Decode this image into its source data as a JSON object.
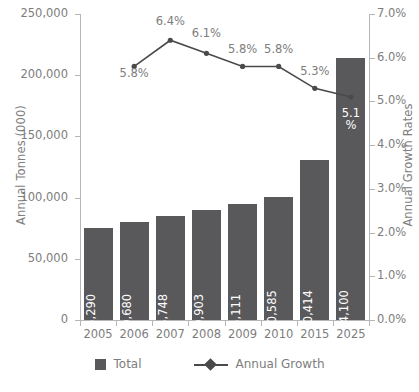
{
  "chart_data": {
    "type": "bar",
    "title": "",
    "subtitle": "",
    "xlabel": "",
    "ylabel": "Annual Tonnes (000)",
    "y2label": "Annual Growth Rates",
    "categories": [
      "2005",
      "2006",
      "2007",
      "2008",
      "2009",
      "2010",
      "2015",
      "2025"
    ],
    "grid": false,
    "legend_position": "bottom",
    "ylim": [
      0,
      250000
    ],
    "yticks": [
      0,
      50000,
      100000,
      150000,
      200000,
      250000
    ],
    "ytick_labels": [
      "0",
      "50,000",
      "100,000",
      "150,000",
      "200,000",
      "250,000"
    ],
    "y2lim": [
      0,
      7
    ],
    "y2ticks": [
      0,
      1,
      2,
      3,
      4,
      5,
      6,
      7
    ],
    "y2tick_labels": [
      "0.0%",
      "1.0%",
      "2.0%",
      "3.0%",
      "4.0%",
      "5.0%",
      "6.0%",
      "7.0%"
    ],
    "series": [
      {
        "name": "Total",
        "type": "bar",
        "axis": "left",
        "color": "#59595b",
        "values": [
          75290,
          79680,
          84748,
          89903,
          95111,
          100585,
          130414,
          214100
        ],
        "data_labels": [
          "75,290",
          "79,680",
          "84,748",
          "89,903",
          "95,111",
          "100,585",
          "130,414",
          "214,100"
        ]
      },
      {
        "name": "Annual Growth",
        "type": "line",
        "axis": "right",
        "color": "#4a4a4a",
        "values": [
          null,
          5.8,
          6.4,
          6.1,
          5.8,
          5.8,
          5.3,
          5.1
        ],
        "data_labels": [
          "",
          "5.8%",
          "6.4%",
          "6.1%",
          "5.8%",
          "5.8%",
          "5.3%",
          "5.1%"
        ],
        "last_label_lines": [
          "5.1",
          "%"
        ]
      }
    ]
  },
  "legend": {
    "items": [
      {
        "label": "Total",
        "marker": "square-swatch",
        "color": "#59595b"
      },
      {
        "label": "Annual Growth",
        "marker": "line-diamond",
        "color": "#4a4a4a"
      }
    ]
  },
  "colors": {
    "bar": "#59595b",
    "line": "#4a4a4a",
    "axis": "#b6b6b6",
    "text": "#7d7d7d",
    "bar_label_text": "#ffffff",
    "background": "#ffffff"
  }
}
